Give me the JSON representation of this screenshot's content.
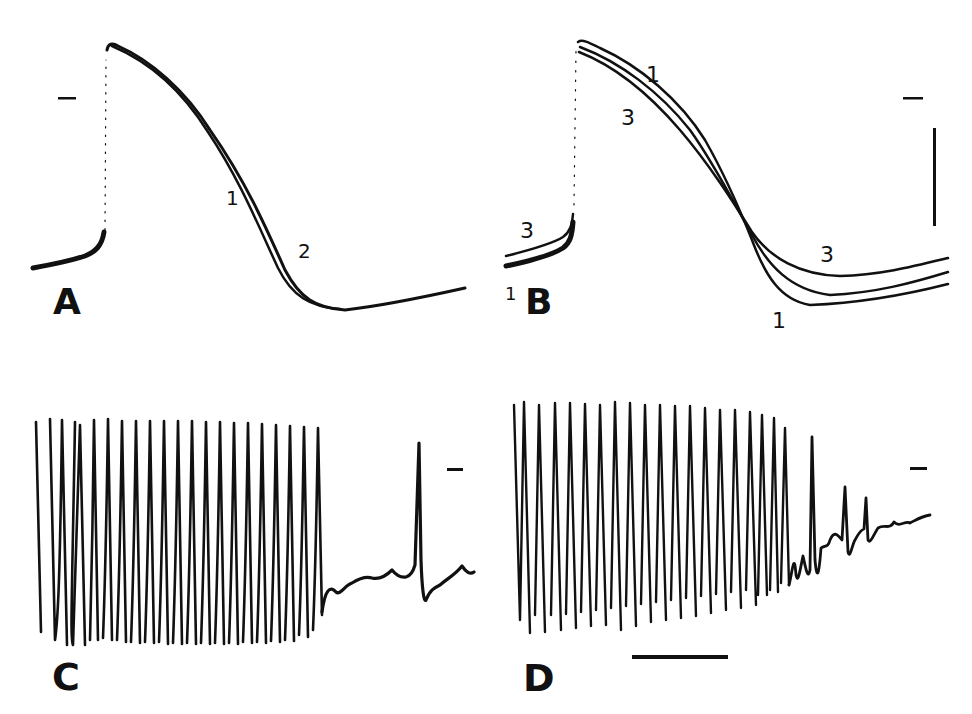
{
  "figure": {
    "panels": [
      {
        "id": "A",
        "label": "A",
        "trace_labels": [
          "1",
          "2"
        ],
        "has_zero_marker": true
      },
      {
        "id": "B",
        "label": "B",
        "trace_labels": [
          "1",
          "3",
          "3",
          "1",
          "3",
          "1"
        ],
        "has_zero_marker": true,
        "has_vertical_scale_bar": true
      },
      {
        "id": "C",
        "label": "C",
        "spike_count_train": 23,
        "isolated_spikes_after_train": 1,
        "has_zero_marker": true
      },
      {
        "id": "D",
        "label": "D",
        "spike_count_train": 27,
        "has_zero_marker": true,
        "has_horizontal_scale_bar": true
      }
    ],
    "colors": {
      "ink": "#111111",
      "background": "#ffffff"
    }
  },
  "labels": {
    "A": "A",
    "B": "B",
    "C": "C",
    "D": "D",
    "a_trace1": "1",
    "a_trace2": "2",
    "b_top_1": "1",
    "b_top_3": "3",
    "b_left_3": "3",
    "b_left_1": "1",
    "b_right_3": "3",
    "b_right_1": "1"
  }
}
